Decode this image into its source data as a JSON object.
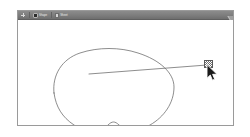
{
  "screen": {
    "width": 250,
    "height": 137,
    "background_color": "#ffffff"
  },
  "window": {
    "name": "drawing-application-window",
    "background_color": "#ffffff",
    "border_color": "#9a9a9a",
    "corner_resize_grip": "resize-grip-icon"
  },
  "toolbar": {
    "background_color": "#7d7d7d",
    "text_color": "#e8e8e8",
    "items": [
      {
        "icon": "plus-icon",
        "label": "",
        "interactable": true
      },
      {
        "icon": "shape-tool-icon",
        "label": "Shape",
        "interactable": true
      },
      {
        "icon": "page-icon",
        "label": "Sheet",
        "interactable": true
      }
    ]
  },
  "canvas": {
    "name": "drawing-canvas",
    "background_color": "#ffffff",
    "stroke_color": "#5b5b5b",
    "stroke_width": 0.7,
    "shapes": [
      {
        "name": "freehand-blob-path",
        "type": "closed-curve",
        "description": "hand-drawn rounded heart-like blob outline",
        "path": "M 36 72 C 34 54, 44 38, 62 32 C 80 26, 102 26, 120 32 C 142 39, 156 52, 156 66 C 156 82, 146 96, 132 104 C 120 111, 108 110, 101 104 C 97 100, 94 100, 90 104 C 82 112, 68 112, 56 104 C 44 96, 38 86, 36 72 Z"
      },
      {
        "name": "pointer-line-segment",
        "type": "line",
        "x1": 88,
        "y1": 73,
        "x2": 206,
        "y2": 64
      }
    ]
  },
  "selection": {
    "handle": {
      "name": "anchor-point-handle",
      "x": 204,
      "y": 60,
      "width": 9,
      "height": 8,
      "style": "checkered-square",
      "border_color": "#5a5a5a",
      "fill_color": "#ffffff"
    }
  },
  "cursor": {
    "name": "mouse-pointer",
    "type": "arrow",
    "x": 206,
    "y": 64,
    "fill_color": "#1a1a1a",
    "outline_color": "#ffffff"
  }
}
